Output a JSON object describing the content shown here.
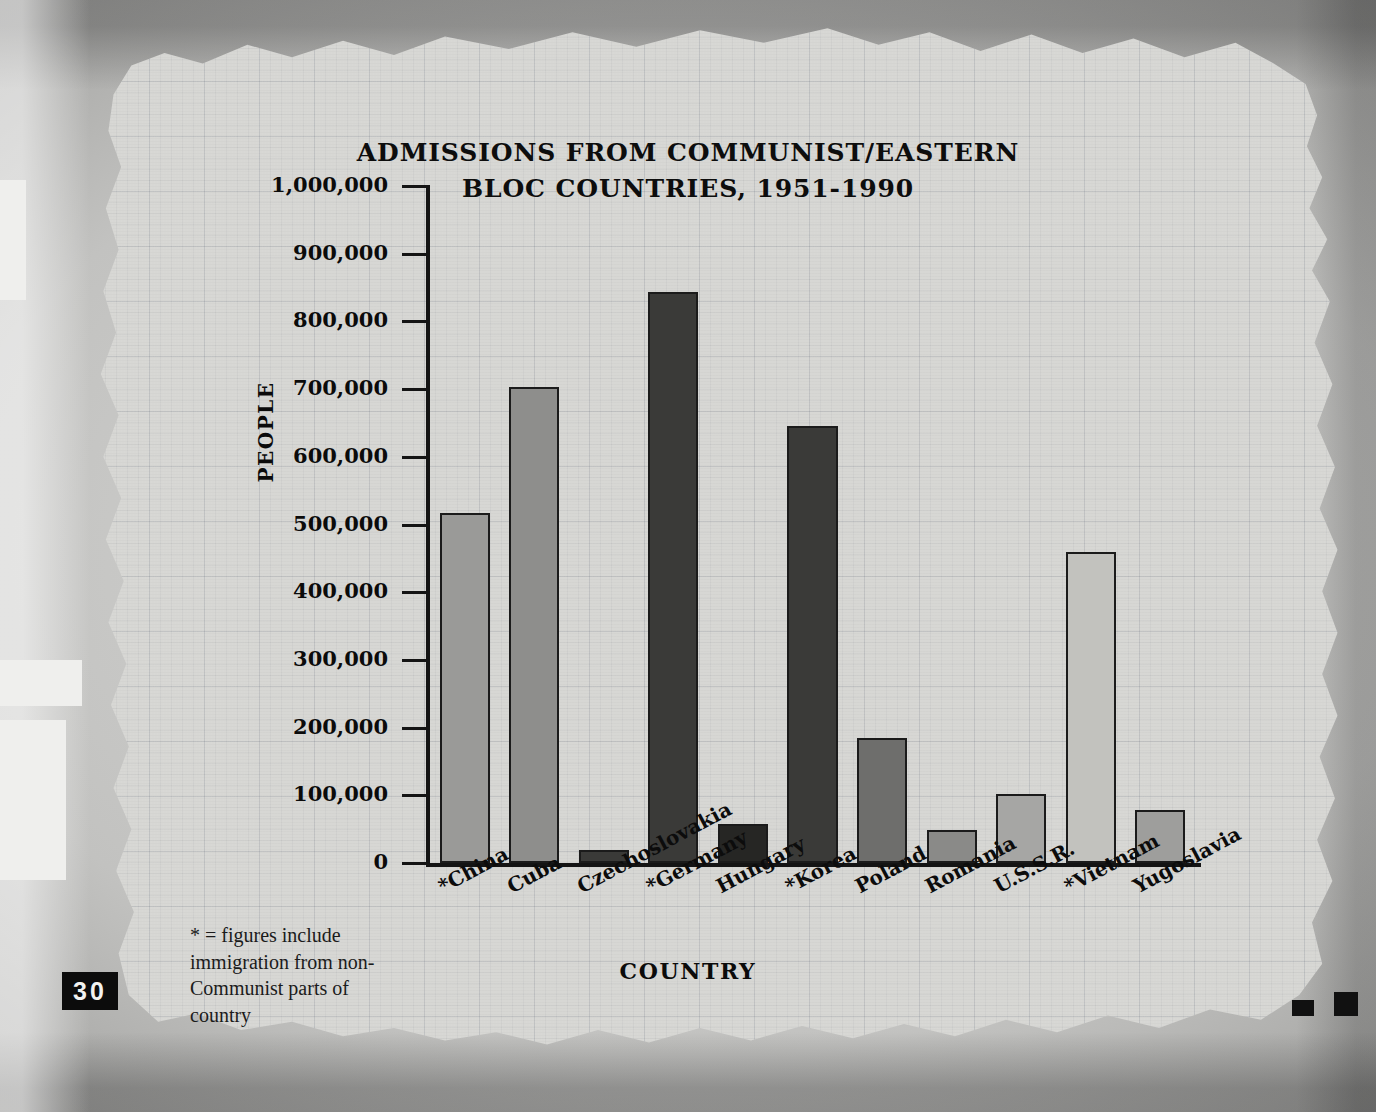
{
  "page": {
    "page_number": "30",
    "footnote": "* = figures include immigration from non-Communist parts of country"
  },
  "chart_data": {
    "type": "bar",
    "title": "ADMISSIONS FROM COMMUNIST/EASTERN BLOC COUNTRIES, 1951-1990",
    "title_line1": "ADMISSIONS FROM COMMUNIST/EASTERN",
    "title_line2": "BLOC COUNTRIES, 1951-1990",
    "xlabel": "COUNTRY",
    "ylabel": "PEOPLE",
    "ylim": [
      0,
      1000000
    ],
    "grid": true,
    "legend": "none",
    "ytick_labels": [
      "1,000,000",
      "900,000",
      "800,000",
      "700,000",
      "600,000",
      "500,000",
      "400,000",
      "300,000",
      "200,000",
      "100,000",
      "0"
    ],
    "ytick_values": [
      1000000,
      900000,
      800000,
      700000,
      600000,
      500000,
      400000,
      300000,
      200000,
      100000,
      0
    ],
    "categories": [
      "*China",
      "Cuba",
      "Czechoslovakia",
      "*Germany",
      "Hungary",
      "*Korea",
      "Poland",
      "Romania",
      "U.S.S.R.",
      "*Vietnam",
      "Yugoslavia"
    ],
    "values": [
      517000,
      703000,
      19000,
      843000,
      58000,
      645000,
      185000,
      49000,
      102000,
      460000,
      78000
    ],
    "bar_colors": [
      "#9a9a98",
      "#8e8e8c",
      "#3a3a38",
      "#3a3a38",
      "#262624",
      "#3a3a38",
      "#6e6e6c",
      "#8a8a88",
      "#a6a6a4",
      "#c2c2be",
      "#9e9e9c"
    ]
  }
}
